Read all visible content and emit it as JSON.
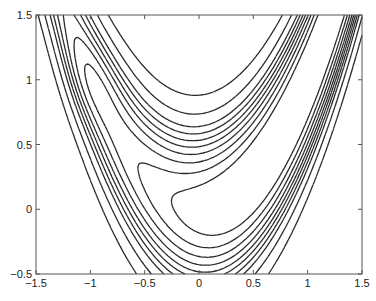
{
  "chart_data": {
    "type": "contour",
    "title": "",
    "xlabel": "",
    "ylabel": "",
    "xlim": [
      -1.5,
      1.5
    ],
    "ylim": [
      -0.5,
      1.5
    ],
    "grid": false,
    "legend": null,
    "x_ticks": [
      {
        "value": -1.5,
        "label": "−1.5"
      },
      {
        "value": -1,
        "label": "−1"
      },
      {
        "value": -0.5,
        "label": "−0.5"
      },
      {
        "value": 0,
        "label": "0"
      },
      {
        "value": 0.5,
        "label": "0.5"
      },
      {
        "value": 1,
        "label": "1"
      },
      {
        "value": 1.5,
        "label": "1.5"
      }
    ],
    "y_ticks": [
      {
        "value": -0.5,
        "label": "−0.5"
      },
      {
        "value": 0,
        "label": "0"
      },
      {
        "value": 0.5,
        "label": "0.5"
      },
      {
        "value": 1,
        "label": "1"
      },
      {
        "value": 1.5,
        "label": "1.5"
      }
    ],
    "function": "f(x,y) = b*(y - x^2)^2 + (a - x)^2 + c*exp(-((x+1)^2+(y-1)^2)/s)",
    "params": {
      "a": 1,
      "b": 6,
      "c": -0.35,
      "s": 0.15
    },
    "contour_levels": [
      0.55,
      0.85,
      1.15,
      1.45,
      1.75,
      2.05,
      2.4,
      2.8,
      3.6,
      5.0
    ],
    "x_axis_center_crossings": [
      0.99,
      0.71,
      0.63,
      0.55,
      0.48,
      0.4,
      0.32,
      0.0,
      -0.16,
      -0.26,
      -0.35,
      -0.42
    ],
    "line_color": "#2a2a2a",
    "axis_color": "#555555"
  }
}
